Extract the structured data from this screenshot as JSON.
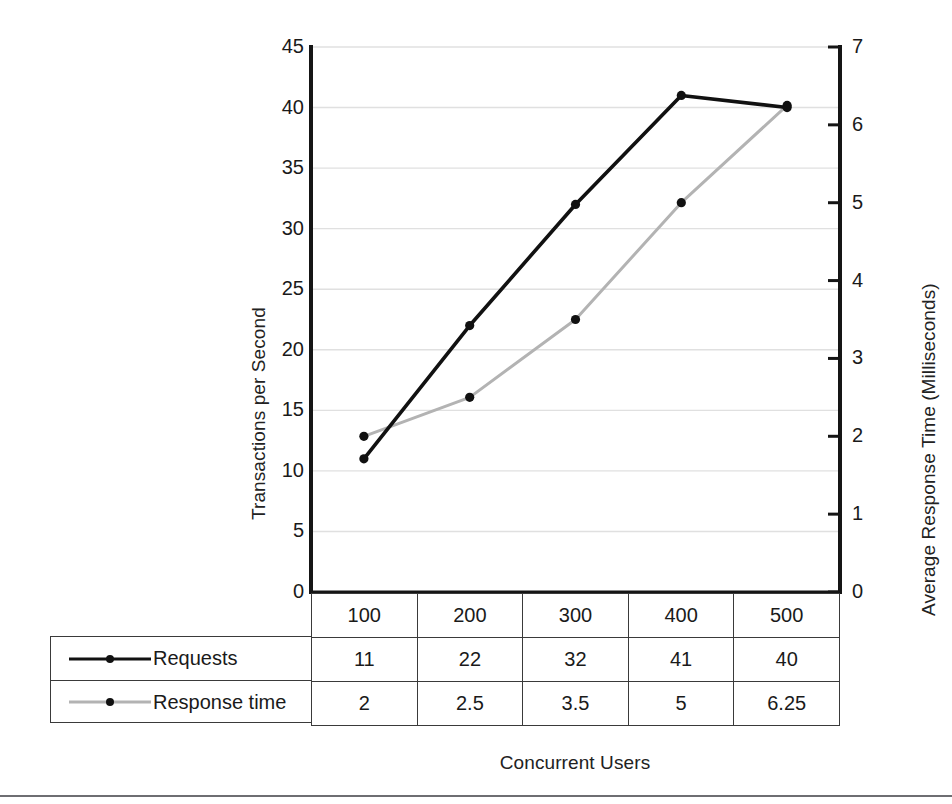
{
  "chart_data": {
    "type": "line",
    "title": "",
    "xlabel": "Concurrent Users",
    "ylabel": "Transactions per Second",
    "y2label": "Average Response Time (Milliseconds)",
    "categories": [
      "100",
      "200",
      "300",
      "400",
      "500"
    ],
    "series": [
      {
        "name": "Requests",
        "axis": "left",
        "color": "#111111",
        "marker": "circle",
        "values": [
          11,
          22,
          32,
          41,
          40
        ]
      },
      {
        "name": "Response time",
        "axis": "right",
        "color": "#b3b3b3",
        "marker": "circle",
        "values": [
          2,
          2.5,
          3.5,
          5,
          6.25
        ]
      }
    ],
    "ylim": [
      0,
      45
    ],
    "y2lim": [
      0,
      7
    ],
    "yticks": [
      "0",
      "5",
      "10",
      "15",
      "20",
      "25",
      "30",
      "35",
      "40",
      "45"
    ],
    "y2ticks": [
      "0",
      "1",
      "2",
      "3",
      "4",
      "5",
      "6",
      "7"
    ],
    "grid": true,
    "gridcolor": "#e0e0e0",
    "legend_position": "bottom-left-table"
  },
  "axes": {
    "left_title": "Transactions per Second",
    "right_title": "Average Response Time (Milliseconds)",
    "bottom_title": "Concurrent Users",
    "left_ticks": [
      "45",
      "40",
      "35",
      "30",
      "25",
      "20",
      "15",
      "10",
      "5",
      "0"
    ],
    "right_ticks": [
      "7",
      "6",
      "5",
      "4",
      "3",
      "2",
      "1",
      "0"
    ]
  },
  "table": {
    "header_row": [
      "100",
      "200",
      "300",
      "400",
      "500"
    ],
    "rows": [
      {
        "label": "Requests",
        "key_color": "#111111",
        "values": [
          "11",
          "22",
          "32",
          "41",
          "40"
        ]
      },
      {
        "label": "Response time",
        "key_color": "#b3b3b3",
        "values": [
          "2",
          "2.5",
          "3.5",
          "5",
          "6.25"
        ]
      }
    ]
  }
}
